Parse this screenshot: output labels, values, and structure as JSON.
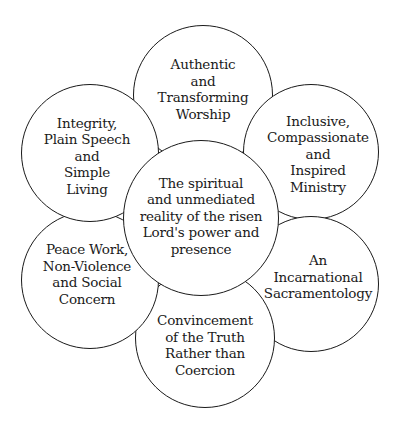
{
  "diagram": {
    "type": "flower-venn",
    "line_color": "#1a1a1a",
    "background": "#ffffff",
    "center": {
      "label": "The spiritual\nand unmediated\nreality of the risen\nLord's power and\npresence"
    },
    "petals": [
      {
        "position": "top",
        "label": "Authentic\nand\nTransforming\nWorship"
      },
      {
        "position": "upper-right",
        "label": "Inclusive,\nCompassionate\nand\nInspired\nMinistry"
      },
      {
        "position": "lower-right",
        "label": "An\nIncarnational\nSacramentology"
      },
      {
        "position": "bottom",
        "label": "Convincement\nof the Truth\nRather than\nCoercion"
      },
      {
        "position": "lower-left",
        "label": "Peace Work,\nNon-Violence\nand Social\nConcern"
      },
      {
        "position": "upper-left",
        "label": "Integrity,\nPlain Speech\nand\nSimple\nLiving"
      }
    ]
  }
}
